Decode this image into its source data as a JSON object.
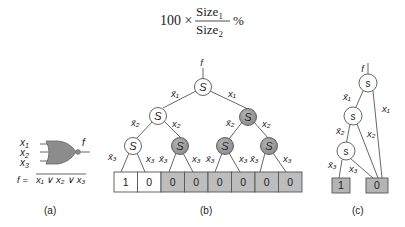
{
  "formula": {
    "prefix": "100 ×",
    "numerator": "Size",
    "numerator_sub": "1",
    "denominator": "Size",
    "denominator_sub": "2",
    "suffix": "%"
  },
  "panel_a": {
    "caption": "(a)",
    "inputs": [
      "x",
      "x",
      "x"
    ],
    "input_subs": [
      "1",
      "2",
      "3"
    ],
    "output": "f",
    "equation_lhs": "f =",
    "equation_rhs": "x₁ ∨ x₂ ∨ x₃",
    "gate": "NOR",
    "gate_color": "#8c8c8c"
  },
  "panel_b": {
    "caption": "(b)",
    "output": "f",
    "node_label": "S",
    "leaves": [
      "1",
      "0",
      "0",
      "0",
      "0",
      "0",
      "0",
      "0"
    ],
    "leaf_colors": [
      "#ffffff",
      "#ffffff",
      "#bdbdbd",
      "#bdbdbd",
      "#bdbdbd",
      "#bdbdbd",
      "#bdbdbd",
      "#bdbdbd"
    ],
    "node_colors": {
      "plain": "#ffffff",
      "shaded": "#9e9e9e"
    },
    "edge_labels": {
      "root_left": "x̄₁",
      "root_right": "x₁",
      "l2_left_left": "x̄₂",
      "l2_left_right": "x₂",
      "l2_right_left": "x̄₂",
      "l2_right_right": "x₂",
      "l3": [
        "x̄₃",
        "x₃",
        "x̄₃",
        "x₃",
        "x̄₃",
        "x₃",
        "x̄₃",
        "x₃"
      ]
    }
  },
  "panel_c": {
    "caption": "(c)",
    "output": "f",
    "node_label": "s",
    "leaves": [
      "1",
      "0"
    ],
    "leaf_color": "#b4b4b4",
    "edge_labels": {
      "x1_bar": "x̄₁",
      "x1": "x₁",
      "x2_bar": "x̄₂",
      "x2": "x₂",
      "x3_bar": "x̄₃",
      "x3": "x₃"
    }
  }
}
